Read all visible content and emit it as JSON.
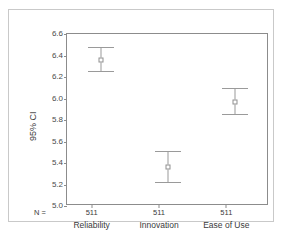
{
  "figure": {
    "clipped_title": "",
    "y_axis_title": "95% CI",
    "n_prefix": "N ="
  },
  "chart_data": {
    "type": "scatter",
    "title": "",
    "subtitle": "",
    "xlabel": "",
    "ylabel": "95% CI",
    "ylim": [
      5.0,
      6.6
    ],
    "yticks": [
      "5.0",
      "5.2",
      "5.4",
      "5.6",
      "5.8",
      "6.0",
      "6.2",
      "6.4",
      "6.6"
    ],
    "ytick_values": [
      5.0,
      5.2,
      5.4,
      5.6,
      5.8,
      6.0,
      6.2,
      6.4,
      6.6
    ],
    "grid": false,
    "legend": "none",
    "categories": [
      "Reliability",
      "Innovation",
      "Ease of Use"
    ],
    "n_counts": [
      "511",
      "511",
      "511"
    ],
    "series": [
      {
        "name": "Mean with 95% CI",
        "values": [
          6.36,
          5.36,
          5.97
        ],
        "ci_lower": [
          6.26,
          5.22,
          5.86
        ],
        "ci_upper": [
          6.48,
          5.51,
          6.1
        ]
      }
    ],
    "points": [
      {
        "category": "Reliability",
        "n": "511",
        "mean": 6.36,
        "ci_lower": 6.26,
        "ci_upper": 6.48
      },
      {
        "category": "Innovation",
        "n": "511",
        "mean": 5.36,
        "ci_lower": 5.22,
        "ci_upper": 5.51
      },
      {
        "category": "Ease of Use",
        "n": "511",
        "mean": 5.97,
        "ci_lower": 5.86,
        "ci_upper": 6.1
      }
    ],
    "colors": {
      "marker": "#8f8f8f",
      "error_bar": "#9a9a9a",
      "axis": "#8c8c8c",
      "panel_border": "#c9c9c9",
      "background": "#ffffff",
      "text": "#3a3a3a"
    }
  }
}
